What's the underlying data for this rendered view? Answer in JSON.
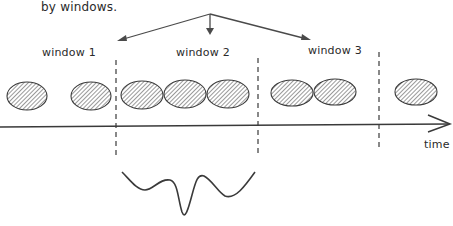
{
  "caption": "by windows.",
  "windows": [
    {
      "label": "window 1"
    },
    {
      "label": "window 2"
    },
    {
      "label": "window 3"
    }
  ],
  "axis": {
    "label": "time"
  },
  "events": {
    "count": 8,
    "fill": "hatched"
  },
  "colors": {
    "stroke": "#3a3a3a",
    "arrow": "#4a4a4a",
    "ellipse_fill": "#d9d9d9",
    "background": "#ffffff"
  }
}
